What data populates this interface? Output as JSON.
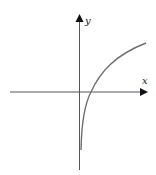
{
  "diagram": {
    "title": "",
    "axes": {
      "x_label": "x",
      "y_label": "y"
    },
    "curve": {
      "description": "logarithmic-shaped curve increasing and concave down, vertical asymptote near the y-axis, crossing the positive x-axis",
      "color": "#6e6e6e"
    },
    "colors": {
      "axis": "#555555",
      "curve": "#6e6e6e",
      "background": "#ffffff"
    }
  }
}
